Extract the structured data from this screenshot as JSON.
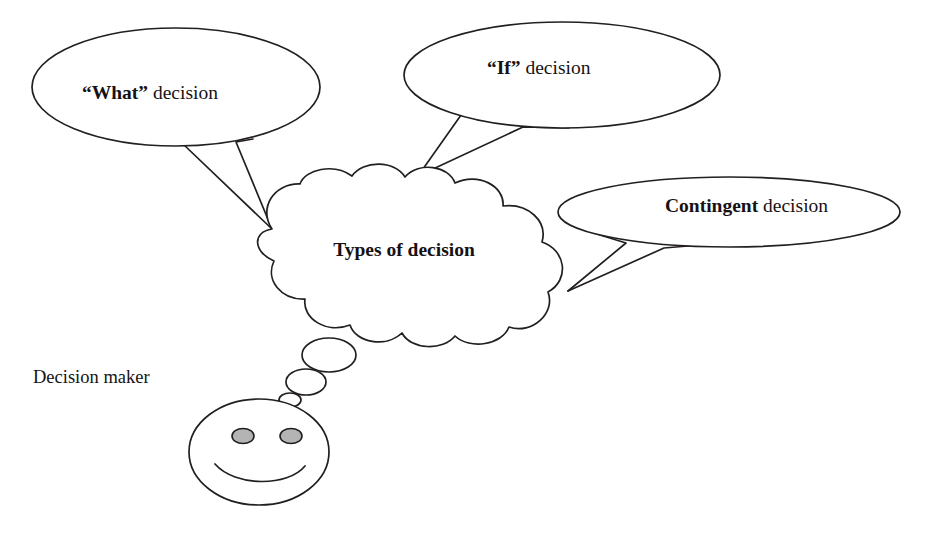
{
  "diagram": {
    "title_text": "Types of decision",
    "actor_label": "Decision maker",
    "background_color": "#ffffff",
    "stroke_color": "#231f20",
    "text_color": "#161214",
    "eye_fill_color": "#b4b4b4",
    "cloud": {
      "label": "Types of decision",
      "center_x": 404,
      "center_y": 252
    },
    "balloons": [
      {
        "id": "what",
        "emphasis": "“What”",
        "rest": " decision",
        "full_label": "“What” decision",
        "center_x": 176,
        "center_y": 87,
        "rx": 144,
        "ry": 59,
        "text_x": 158,
        "text_y": 95
      },
      {
        "id": "if",
        "emphasis": "“If”",
        "rest": " decision",
        "full_label": "“If” decision",
        "center_x": 562,
        "center_y": 75,
        "rx": 158,
        "ry": 53,
        "text_x": 550,
        "text_y": 70
      },
      {
        "id": "contingent",
        "emphasis": "Contingent",
        "rest": " decision",
        "full_label": "Contingent decision",
        "center_x": 729,
        "center_y": 212,
        "rx": 171,
        "ry": 35,
        "text_x": 752,
        "text_y": 208
      }
    ],
    "actor": {
      "label": "Decision maker",
      "label_x": 33,
      "label_y": 379,
      "head_center_x": 259,
      "head_center_y": 452,
      "eyes": [
        {
          "cx": 243,
          "cy": 436
        },
        {
          "cx": 291,
          "cy": 436
        }
      ],
      "thought_bubbles": [
        {
          "cx": 290,
          "cy": 400,
          "rx": 11,
          "ry": 7
        },
        {
          "cx": 306,
          "cy": 382,
          "rx": 20,
          "ry": 13
        },
        {
          "cx": 329,
          "cy": 355,
          "rx": 27,
          "ry": 17
        }
      ]
    }
  }
}
